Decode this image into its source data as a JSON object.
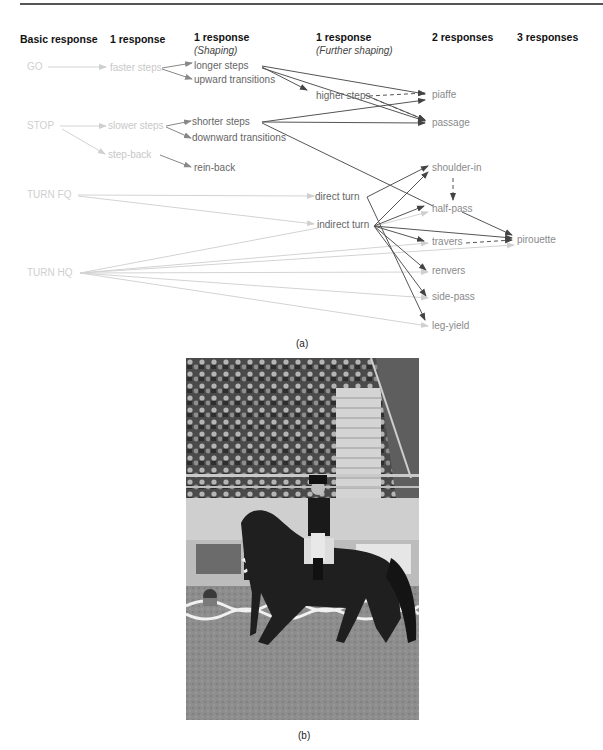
{
  "figure": {
    "panel_a": {
      "caption": "(a)",
      "columns": [
        {
          "title": "Basic response",
          "subtitle": ""
        },
        {
          "title": "1 response",
          "subtitle": ""
        },
        {
          "title": "1 response",
          "subtitle": "(Shaping)"
        },
        {
          "title": "1 response",
          "subtitle": "(Further shaping)"
        },
        {
          "title": "2 responses",
          "subtitle": ""
        },
        {
          "title": "3 responses",
          "subtitle": ""
        }
      ],
      "basic": [
        "GO",
        "STOP",
        "TURN FQ",
        "TURN HQ"
      ],
      "level1": [
        "faster steps",
        "slower steps",
        "step-back"
      ],
      "shaping": [
        "longer steps",
        "upward transitions",
        "shorter steps",
        "downward transitions",
        "rein-back"
      ],
      "further": [
        "higher steps",
        "direct turn",
        "indirect turn"
      ],
      "two_responses": [
        "piaffe",
        "passage",
        "shoulder-in",
        "half-pass",
        "travers",
        "renvers",
        "side-pass",
        "leg-yield"
      ],
      "three_responses": [
        "pirouette"
      ],
      "colors": {
        "basic_text": "#cfcfcf",
        "light_arrow": "#d0d0d0",
        "dark_arrow": "#555555",
        "label": "#666666"
      }
    },
    "panel_b": {
      "caption": "(b)",
      "photo_alt": "dressage-horse-and-rider-photo"
    }
  }
}
